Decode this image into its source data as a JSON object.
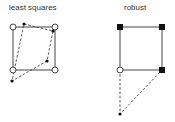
{
  "panels": [
    {
      "title": "least squares",
      "square": {
        "x": 13,
        "y": 27,
        "w": 42,
        "h": 43
      },
      "corner_markers": [
        {
          "x": 13,
          "y": 27,
          "style": "open-circle"
        },
        {
          "x": 55,
          "y": 27,
          "style": "open-circle"
        },
        {
          "x": 13,
          "y": 70,
          "style": "open-circle"
        },
        {
          "x": 55,
          "y": 70,
          "style": "open-circle"
        }
      ],
      "points": [
        {
          "x": 24,
          "y": 24
        },
        {
          "x": 53,
          "y": 31
        },
        {
          "x": 47,
          "y": 61
        },
        {
          "x": 12,
          "y": 81
        }
      ],
      "dashed_path": [
        [
          24,
          24
        ],
        [
          53,
          31
        ],
        [
          47,
          61
        ],
        [
          12,
          81
        ],
        [
          24,
          24
        ]
      ]
    },
    {
      "title": "robust",
      "square": {
        "x": 120,
        "y": 27,
        "w": 42,
        "h": 43
      },
      "corner_markers": [
        {
          "x": 120,
          "y": 27,
          "style": "filled-square"
        },
        {
          "x": 162,
          "y": 27,
          "style": "filled-square"
        },
        {
          "x": 120,
          "y": 70,
          "style": "open-circle"
        },
        {
          "x": 162,
          "y": 70,
          "style": "filled-square"
        }
      ],
      "points": [
        {
          "x": 120,
          "y": 114
        }
      ],
      "dashed_path": [
        [
          120,
          70
        ],
        [
          120,
          114
        ],
        [
          162,
          70
        ]
      ]
    }
  ],
  "colors": {
    "stroke": "#444444",
    "marker": "#111111",
    "text": "#333333"
  }
}
